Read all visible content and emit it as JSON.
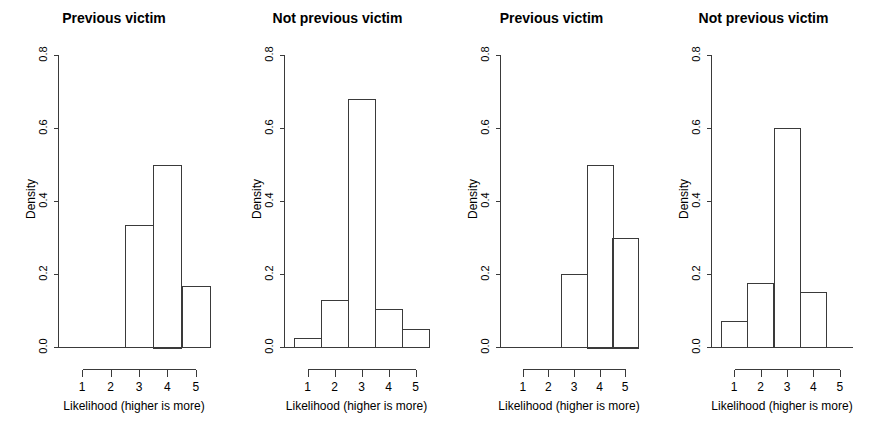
{
  "figure": {
    "width": 871,
    "height": 431,
    "background": "#ffffff",
    "axis_color": "#3a3a3a",
    "text_color": "#000000"
  },
  "chart_data": [
    {
      "type": "bar",
      "title": "Previous victim",
      "xlabel": "Likelihood (higher is more)",
      "ylabel": "Density",
      "xtick_labels": [
        "1",
        "2",
        "3",
        "4",
        "5"
      ],
      "xticks": [
        1,
        2,
        3,
        4,
        5
      ],
      "ytick_labels": [
        "0.0",
        "0.2",
        "0.4",
        "0.6",
        "0.8"
      ],
      "yticks": [
        0.0,
        0.2,
        0.4,
        0.6,
        0.8
      ],
      "ylim": [
        0.0,
        0.8
      ],
      "xlim": [
        0.5,
        5.5
      ],
      "grid": false,
      "legend": "none",
      "bins": [
        {
          "start": 2.5,
          "end": 3.5,
          "value": 0.333
        },
        {
          "start": 3.5,
          "end": 4.5,
          "value": 0.5
        },
        {
          "start": 4.5,
          "end": 5.5,
          "value": 0.167
        }
      ],
      "categories": [
        "3",
        "4",
        "5"
      ],
      "values": [
        0.333,
        0.5,
        0.167
      ]
    },
    {
      "type": "bar",
      "title": "Not previous victim",
      "xlabel": "Likelihood (higher is more)",
      "ylabel": "Density",
      "xtick_labels": [
        "1",
        "2",
        "3",
        "4",
        "5"
      ],
      "xticks": [
        1,
        2,
        3,
        4,
        5
      ],
      "ytick_labels": [
        "0.0",
        "0.2",
        "0.4",
        "0.6",
        "0.8"
      ],
      "yticks": [
        0.0,
        0.2,
        0.4,
        0.6,
        0.8
      ],
      "ylim": [
        0.0,
        0.8
      ],
      "xlim": [
        0.5,
        5.5
      ],
      "grid": false,
      "legend": "none",
      "bins": [
        {
          "start": 0.5,
          "end": 1.5,
          "value": 0.025
        },
        {
          "start": 1.5,
          "end": 2.5,
          "value": 0.13
        },
        {
          "start": 2.5,
          "end": 3.5,
          "value": 0.68
        },
        {
          "start": 3.5,
          "end": 4.5,
          "value": 0.105
        },
        {
          "start": 4.5,
          "end": 5.5,
          "value": 0.05
        }
      ],
      "categories": [
        "1",
        "2",
        "3",
        "4",
        "5"
      ],
      "values": [
        0.025,
        0.13,
        0.68,
        0.105,
        0.05
      ]
    },
    {
      "type": "bar",
      "title": "Previous victim",
      "xlabel": "Likelihood (higher is more)",
      "ylabel": "Density",
      "xtick_labels": [
        "1",
        "2",
        "3",
        "4",
        "5"
      ],
      "xticks": [
        1,
        2,
        3,
        4,
        5
      ],
      "ytick_labels": [
        "0.0",
        "0.2",
        "0.4",
        "0.6",
        "0.8"
      ],
      "yticks": [
        0.0,
        0.2,
        0.4,
        0.6,
        0.8
      ],
      "ylim": [
        0.0,
        0.8
      ],
      "xlim": [
        0.5,
        5.5
      ],
      "grid": false,
      "legend": "none",
      "bins": [
        {
          "start": 2.5,
          "end": 3.5,
          "value": 0.2
        },
        {
          "start": 3.5,
          "end": 4.5,
          "value": 0.5
        },
        {
          "start": 4.5,
          "end": 5.5,
          "value": 0.3
        }
      ],
      "categories": [
        "3",
        "4",
        "5"
      ],
      "values": [
        0.2,
        0.5,
        0.3
      ]
    },
    {
      "type": "bar",
      "title": "Not previous victim",
      "xlabel": "Likelihood (higher is more)",
      "ylabel": "Density",
      "xtick_labels": [
        "1",
        "2",
        "3",
        "4",
        "5"
      ],
      "xticks": [
        1,
        2,
        3,
        4,
        5
      ],
      "ytick_labels": [
        "0.0",
        "0.2",
        "0.4",
        "0.6",
        "0.8"
      ],
      "yticks": [
        0.0,
        0.2,
        0.4,
        0.6,
        0.8
      ],
      "ylim": [
        0.0,
        0.8
      ],
      "xlim": [
        0.5,
        5.5
      ],
      "grid": false,
      "legend": "none",
      "bins": [
        {
          "start": 0.5,
          "end": 1.5,
          "value": 0.07
        },
        {
          "start": 1.5,
          "end": 2.5,
          "value": 0.175
        },
        {
          "start": 2.5,
          "end": 3.5,
          "value": 0.6
        },
        {
          "start": 3.5,
          "end": 4.5,
          "value": 0.15
        }
      ],
      "categories": [
        "1",
        "2",
        "3",
        "4"
      ],
      "values": [
        0.07,
        0.175,
        0.6,
        0.15
      ]
    }
  ],
  "panels_layout": [
    {
      "left": 0,
      "width": 228
    },
    {
      "left": 228,
      "width": 219
    },
    {
      "left": 447,
      "width": 209
    },
    {
      "left": 656,
      "width": 215
    }
  ]
}
